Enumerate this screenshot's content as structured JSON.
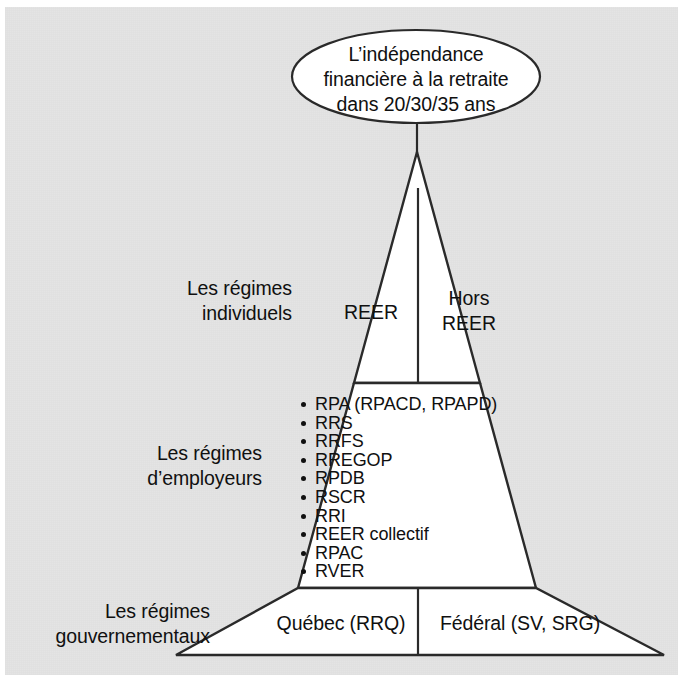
{
  "figure": {
    "type": "pyramid-diagram",
    "language": "fr",
    "background_color": "#e4e4e4",
    "line_color": "#2a2a2a",
    "fill_color": "#ffffff"
  },
  "goal": {
    "shape": "ellipse",
    "text": "L’indépendance\nfinancière à la retraite\ndans 20/30/35 ans"
  },
  "tiers": [
    {
      "id": "individuels",
      "side_label": "Les régimes\nindividuels",
      "cells": [
        {
          "id": "reer",
          "label": "REER"
        },
        {
          "id": "hors-reer",
          "label": "Hors\nREER"
        }
      ]
    },
    {
      "id": "employeurs",
      "side_label": "Les régimes\nd’employeurs",
      "items": [
        "RPA (RPACD, RPAPD)",
        "RRS",
        "RRFS",
        "RREGOP",
        "RPDB",
        "RSCR",
        "RRI",
        "REER collectif",
        "RPAC",
        "RVER"
      ]
    },
    {
      "id": "gouvernementaux",
      "side_label": "Les régimes\ngouvernementaux",
      "cells": [
        {
          "id": "quebec",
          "label": "Québec (RRQ)"
        },
        {
          "id": "federal",
          "label": "Fédéral (SV, SRG)"
        }
      ]
    }
  ]
}
